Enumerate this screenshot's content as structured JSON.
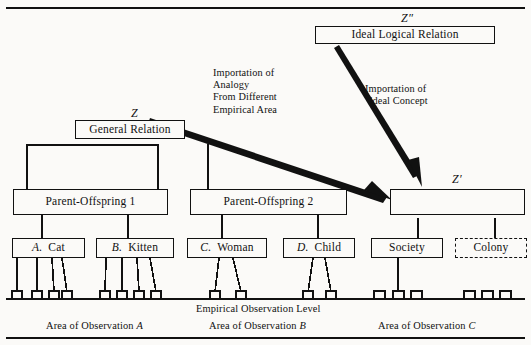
{
  "diagram": {
    "title_rule_top": true,
    "nodes": {
      "ideal_logical_relation": {
        "label": "Ideal Logical Relation",
        "tag": "Z″"
      },
      "general_relation": {
        "label": "General Relation",
        "tag": "Z"
      },
      "z_prime": {
        "label": "",
        "tag": "Z′"
      },
      "parent_offspring_1": {
        "label": "Parent-Offspring 1"
      },
      "parent_offspring_2": {
        "label": "Parent-Offspring 2"
      },
      "cat": {
        "letter": "A.",
        "label": "Cat"
      },
      "kitten": {
        "letter": "B.",
        "label": "Kitten"
      },
      "woman": {
        "letter": "C.",
        "label": "Woman"
      },
      "child": {
        "letter": "D.",
        "label": "Child"
      },
      "society": {
        "letter": "",
        "label": "Society"
      },
      "colony": {
        "letter": "",
        "label": "Colony",
        "style": "dashed"
      }
    },
    "arrows": {
      "analogy": {
        "lines": [
          "Importation of",
          "Analogy",
          "From Different",
          "Empirical Area"
        ]
      },
      "ideal_concept": {
        "lines": [
          "Importation of",
          "Ideal Concept"
        ]
      }
    },
    "captions": {
      "observation_level": "Empirical  Observation Level",
      "area_a_pre": "Area of Observation ",
      "area_a_letter": "A",
      "area_b_pre": "Area of Observation ",
      "area_b_letter": "B",
      "area_c_pre": "Area of Observation ",
      "area_c_letter": "C"
    },
    "colors": {
      "ink": "#111111",
      "paper": "#fbfaf8"
    }
  }
}
